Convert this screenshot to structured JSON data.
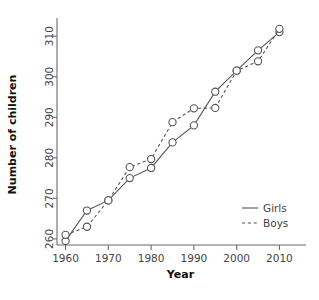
{
  "chart_data": {
    "type": "line",
    "title": "",
    "xlabel": "Year",
    "ylabel": "Number of children",
    "x": [
      1960,
      1965,
      1970,
      1975,
      1980,
      1985,
      1990,
      1995,
      2000,
      2005,
      2010
    ],
    "xlim": [
      1958,
      2012
    ],
    "ylim": [
      258.5,
      313
    ],
    "xticks": [
      1960,
      1970,
      1980,
      1990,
      2000,
      2010
    ],
    "xtick_labels": [
      "1960",
      "1970",
      "1980",
      "1990",
      "2000",
      "2010"
    ],
    "yticks": [
      260,
      270,
      280,
      290,
      300,
      310
    ],
    "ytick_labels": [
      "260",
      "270",
      "280",
      "290",
      "300",
      "310"
    ],
    "grid": false,
    "legend_position": "bottom-right",
    "series": [
      {
        "name": "Girls",
        "style": "solid",
        "marker": "open-circle",
        "color": "#555555",
        "values": [
          259.5,
          267.0,
          269.5,
          275.0,
          277.5,
          283.8,
          288.0,
          296.3,
          301.5,
          306.5,
          311.0
        ]
      },
      {
        "name": "Boys",
        "style": "dotted",
        "marker": "open-circle",
        "color": "#555555",
        "values": [
          261.0,
          263.0,
          269.5,
          277.7,
          279.7,
          288.8,
          292.2,
          292.3,
          301.5,
          303.8,
          311.8
        ]
      }
    ]
  },
  "legend": {
    "items": [
      {
        "label": "Girls",
        "style": "solid"
      },
      {
        "label": "Boys",
        "style": "dotted"
      }
    ]
  },
  "axis": {
    "x_title": "Year",
    "y_title": "Number of children"
  }
}
